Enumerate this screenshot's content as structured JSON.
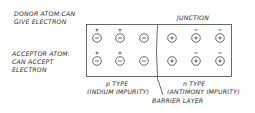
{
  "labels": {
    "donor_line1": "DONOR ATOM:CAN",
    "donor_line2": "GIVE ELECTRON",
    "acceptor_line1": "ACCEPTOR ATOM:",
    "acceptor_line2": "CAN ACCEPT",
    "acceptor_line3": "ELECTRON",
    "junction": "JUNCTION",
    "p_type": "p TYPE",
    "p_impurity": "(INDIUM IMPURITY)",
    "n_type": "n TYPE",
    "n_impurity": "(ANTIMONY IMPURITY)",
    "barrier": "BARRIER LAYER"
  },
  "p_region": {
    "ions": "negative",
    "rows": [
      [
        "ion-with-hole",
        "ion-with-hole",
        "ion"
      ],
      [
        "ion-with-hole",
        "ion-with-hole",
        "ion"
      ]
    ]
  },
  "n_region": {
    "ions": "positive",
    "rows": [
      [
        "ion",
        "ion-with-electron",
        "ion-with-electron"
      ],
      [
        "ion",
        "ion-with-electron",
        "ion-with-electron"
      ]
    ]
  }
}
